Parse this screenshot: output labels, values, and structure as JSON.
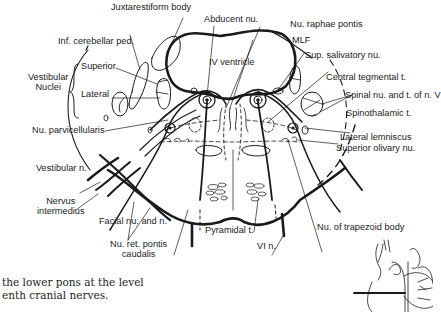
{
  "diagram": {
    "labels": {
      "juxtarestiform_body": "Juxtarestiform body",
      "abducent_nu": "Abducent nu.",
      "inf_cerebellar_ped": "Inf. cerebellar ped.",
      "nu_raphae_pontis": "Nu. raphae pontis",
      "mlf": "MLF",
      "sup_salivatory_nu": "Sup. salivatory nu.",
      "iv_ventricle": "IV ventricle",
      "vestibular_nuclei_line1": "Vestibular",
      "vestibular_nuclei_line2": "Nuclei",
      "superior": "Superior",
      "lateral": "Lateral",
      "central_tegmental_t": "Central tegmental t.",
      "spinal_nu_t_n_v": "Spinal nu. and t. of n. V",
      "spinothalamic_t": "Spinothalamic t.",
      "nu_parvicellularis": "Nu. parvicellularis",
      "lateral_lemniscus": "Lateral lemniscus",
      "superior_olivary_nu": "Superior olivary nu.",
      "vestibular_n": "Vestibular n.",
      "nervus_intermedius_line1": "Nervus",
      "nervus_intermedius_line2": "intermedius",
      "facial_nu_and_n": "Facial nu. and n.",
      "pyramidal_t": "Pyramidal t.",
      "nu_of_trapezoid_body": "Nu. of trapezoid body",
      "nu_ret_pontis_line1": "Nu. ret. pontis",
      "nu_ret_pontis_line2": "caudalis",
      "vi_n": "VI n."
    },
    "caption": {
      "line1": "the lower pons at the level",
      "line2": "enth cranial nerves."
    },
    "colors": {
      "ink": "#1a1a1a",
      "background": "#ffffff"
    }
  }
}
